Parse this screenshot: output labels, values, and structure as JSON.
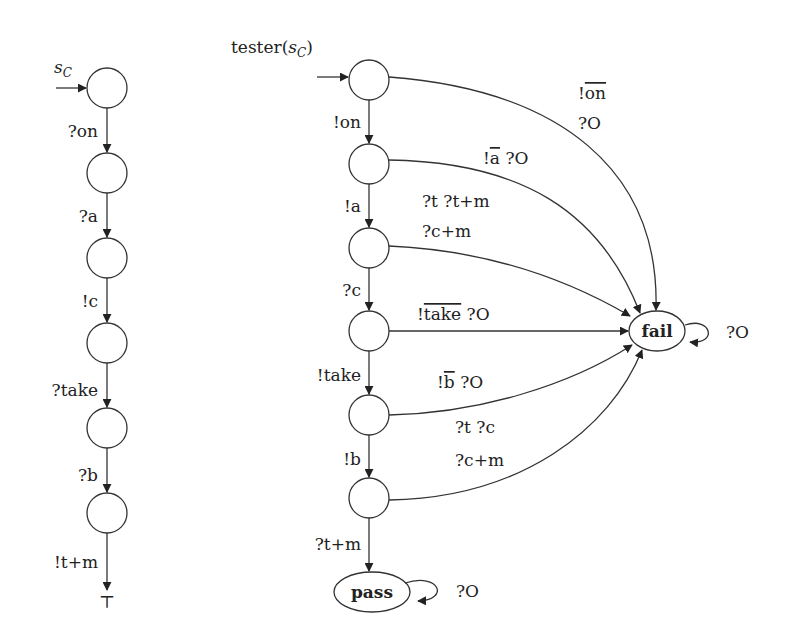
{
  "left_automaton": {
    "title": "s",
    "title_sub": "C",
    "transitions": [
      "?on",
      "?a",
      "!c",
      "?take",
      "?b",
      "!t+m"
    ],
    "terminal": "⊤"
  },
  "right_automaton": {
    "title_prefix": "tester(",
    "title_var": "s",
    "title_sub": "C",
    "title_suffix": ")",
    "spine_transitions": [
      "!on",
      "!a",
      "?c",
      "!take",
      "!b",
      "?t+m"
    ],
    "fail_node": "fail",
    "pass_node": "pass",
    "fail_selfloop": "?O",
    "pass_selfloop": "?O",
    "fail_edges": [
      {
        "from": 0,
        "label_lines": [
          "!on",
          "?O"
        ],
        "overline": "on"
      },
      {
        "from": 1,
        "label_lines": [
          "!a ?O",
          "?t ?t+m"
        ],
        "overline": "a"
      },
      {
        "from": 2,
        "label_lines": [
          "?c+m"
        ]
      },
      {
        "from": 3,
        "label_lines": [
          "!take ?O"
        ],
        "overline": "take"
      },
      {
        "from": 4,
        "label_lines": [
          "!b ?O",
          "?t ?c"
        ],
        "overline": "b"
      },
      {
        "from": 5,
        "label_lines": [
          "?c+m"
        ]
      }
    ],
    "labels": {
      "e0_l1_bang": "!",
      "e0_l1_bar": "on",
      "e0_l2": "?O",
      "e1_bang": "!",
      "e1_bar": "a",
      "e1_rest": " ?O",
      "e1_l2": "?t ?t+m",
      "e2": "?c+m",
      "e3_bang": "!",
      "e3_bar": "take",
      "e3_rest": " ?O",
      "e4_bang": "!",
      "e4_bar": "b",
      "e4_rest": " ?O",
      "e4_l2": "?t ?c",
      "e5": "?c+m"
    }
  }
}
